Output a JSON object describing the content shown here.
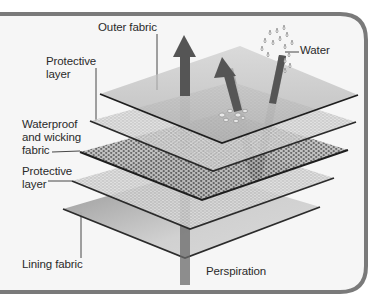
{
  "diagram": {
    "labels": {
      "outer_fabric": "Outer fabric",
      "protective_layer_top": "Protective\nlayer",
      "waterproof_wicking": "Waterproof\nand wicking\nfabric",
      "protective_layer_bottom": "Protective\nlayer",
      "lining_fabric": "Lining fabric",
      "water": "Water",
      "perspiration": "Perspiration"
    },
    "layers": [
      {
        "name": "Outer fabric",
        "texture": "solid"
      },
      {
        "name": "Protective layer",
        "texture": "fine-dots"
      },
      {
        "name": "Waterproof and wicking fabric",
        "texture": "perforated"
      },
      {
        "name": "Protective layer",
        "texture": "fine-dots"
      },
      {
        "name": "Lining fabric",
        "texture": "solid"
      }
    ],
    "arrows": [
      {
        "name": "perspiration-arrow",
        "direction": "up"
      },
      {
        "name": "water-repelled-arrow",
        "direction": "down-then-up"
      }
    ],
    "colors": {
      "frame": "#7a7a7a",
      "arrow": "#555555",
      "layer_edge": "#2b2b2b",
      "text": "#2a2a2a"
    }
  }
}
